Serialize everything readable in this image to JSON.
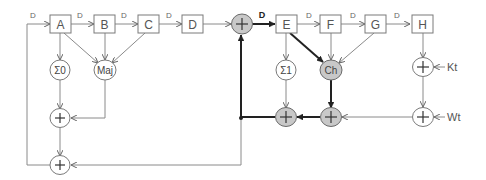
{
  "diagram": {
    "registers": [
      {
        "id": "A",
        "label": "A"
      },
      {
        "id": "B",
        "label": "B"
      },
      {
        "id": "C",
        "label": "C"
      },
      {
        "id": "D",
        "label": "D"
      },
      {
        "id": "E",
        "label": "E"
      },
      {
        "id": "F",
        "label": "F"
      },
      {
        "id": "G",
        "label": "G"
      },
      {
        "id": "H",
        "label": "H"
      }
    ],
    "delay_label": "D",
    "functions": {
      "sigma0": "Σ0",
      "maj": "Maj",
      "sigma1": "Σ1",
      "ch": "Ch"
    },
    "adder_symbol": "+",
    "inputs": {
      "kt": "Kt",
      "wt": "Wt"
    },
    "colors": {
      "highlight_fill": "#c8c8c8",
      "line": "#8a8a8a",
      "critical_path": "#222222"
    }
  }
}
